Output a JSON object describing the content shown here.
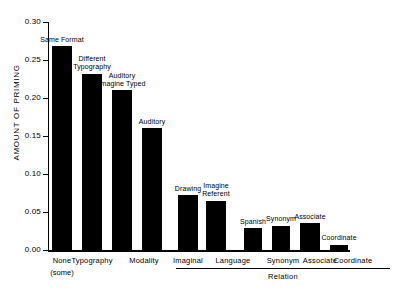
{
  "chart_data": {
    "type": "bar",
    "title": "",
    "xlabel": "Relation",
    "ylabel": "AMOUNT OF PRIMING",
    "ylim": [
      0.0,
      0.3
    ],
    "ytick_labels": [
      "0.30",
      "0.25",
      "0.20",
      "0.15",
      "0.10",
      "0.05",
      "0.00"
    ],
    "ytick_values": [
      0.3,
      0.25,
      0.2,
      0.15,
      0.1,
      0.05,
      0.0
    ],
    "grid": false,
    "legend": "none",
    "categories": [
      "Same Format",
      "Different Typography",
      "Auditory Imagine Typed",
      "Auditory",
      "Drawing",
      "Imagine Referent",
      "Spanish",
      "Synonym",
      "Associate",
      "Coordinate"
    ],
    "values": [
      0.268,
      0.232,
      0.21,
      0.16,
      0.072,
      0.065,
      0.029,
      0.032,
      0.035,
      0.007
    ],
    "bar_labels": [
      {
        "line1": "Same Format",
        "line2": ""
      },
      {
        "line1": "Different",
        "line2": "Typography"
      },
      {
        "line1": "Auditory",
        "line2": "Imagine Typed"
      },
      {
        "line1": "Auditory",
        "line2": ""
      },
      {
        "line1": "Drawing",
        "line2": ""
      },
      {
        "line1": "Imagine",
        "line2": "Referent"
      },
      {
        "line1": "Spanish",
        "line2": ""
      },
      {
        "line1": "Synonym",
        "line2": ""
      },
      {
        "line1": "Associate",
        "line2": ""
      },
      {
        "line1": "Coordinate",
        "line2": ""
      }
    ],
    "x_axis_groups": [
      {
        "label": "None",
        "sublabel": "(some)",
        "bracket": false
      },
      {
        "label": "Typography",
        "sublabel": "",
        "bracket": false
      },
      {
        "label": "Modality",
        "sublabel": "",
        "bracket": false
      },
      {
        "label": "Imaginal",
        "sublabel": "",
        "bracket": true
      },
      {
        "label": "Language",
        "sublabel": "",
        "bracket": true
      },
      {
        "label": "Synonym",
        "sublabel": "",
        "bracket": true
      },
      {
        "label": "Associate",
        "sublabel": "",
        "bracket": true
      },
      {
        "label": "Coordinate",
        "sublabel": "",
        "bracket": true
      }
    ],
    "group_bracket_title": "Relation",
    "bar_color": "#000000",
    "axis_color": "#000000",
    "background_color": "#ffffff"
  }
}
